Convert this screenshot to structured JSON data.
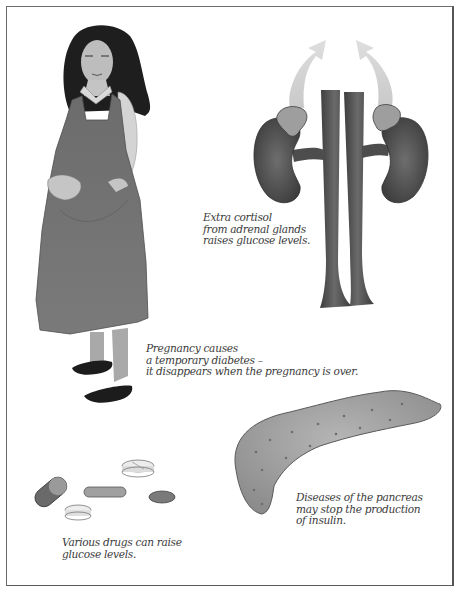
{
  "figure": {
    "frame_color": "#5e5e5e",
    "panels": [
      {
        "id": "pregnancy",
        "subject": "pregnant-woman",
        "caption": "Pregnancy causes\na temporary diabetes –\nit disappears when the pregnancy is over."
      },
      {
        "id": "adrenal",
        "subject": "kidneys-adrenal-glands",
        "caption": "Extra cortisol\nfrom adrenal glands\nraises glucose levels."
      },
      {
        "id": "pancreas",
        "subject": "pancreas",
        "caption": "Diseases of the pancreas\nmay stop the production\nof insulin."
      },
      {
        "id": "drugs",
        "subject": "pills",
        "caption": "Various drugs can raise\nglucose levels."
      }
    ]
  }
}
